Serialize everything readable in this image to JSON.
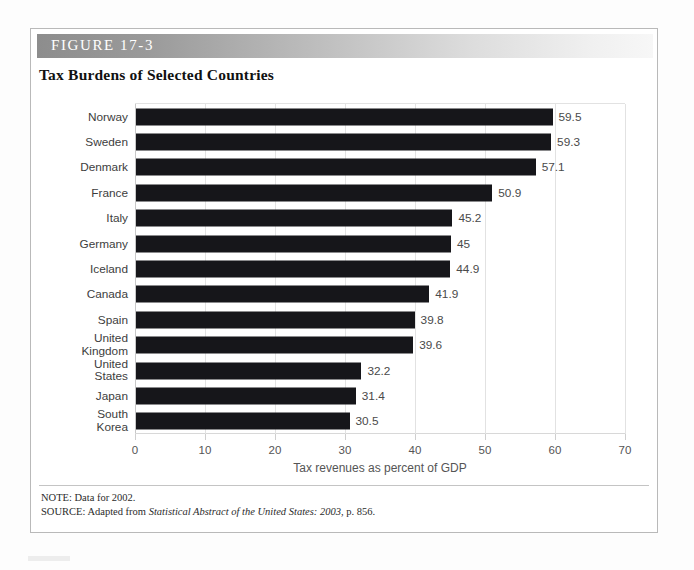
{
  "figure": {
    "label": "FIGURE 17-3",
    "title": "Tax Burdens of Selected Countries",
    "note": "NOTE: Data for 2002.",
    "source_prefix": "SOURCE: Adapted from ",
    "source_italic": "Statistical Abstract of the United States: 2003",
    "source_suffix": ", p. 856."
  },
  "colors": {
    "bar": "#16161a",
    "gridline": "#e2e2e2",
    "header_gradient_start": "#8d8d8d",
    "header_gradient_end": "#f7f7f7",
    "label_text": "#3d3d3d",
    "value_text": "#4a4a4a"
  },
  "chart_data": {
    "type": "bar",
    "orientation": "horizontal",
    "title": "Tax Burdens of Selected Countries",
    "xlabel": "Tax revenues as percent of GDP",
    "ylabel": "",
    "xlim": [
      0,
      70
    ],
    "xticks": [
      0,
      10,
      20,
      30,
      40,
      50,
      60,
      70
    ],
    "xtick_labels": [
      "0",
      "10",
      "20",
      "30",
      "40",
      "50",
      "60",
      "70"
    ],
    "grid": true,
    "legend": false,
    "categories": [
      "Norway",
      "Sweden",
      "Denmark",
      "France",
      "Italy",
      "Germany",
      "Iceland",
      "Canada",
      "Spain",
      "United\nKingdom",
      "United\nStates",
      "Japan",
      "South\nKorea"
    ],
    "values": [
      59.5,
      59.3,
      57.1,
      50.9,
      45.2,
      45,
      44.9,
      41.9,
      39.8,
      39.6,
      32.2,
      31.4,
      30.5
    ],
    "value_labels": [
      "59.5",
      "59.3",
      "57.1",
      "50.9",
      "45.2",
      "45",
      "44.9",
      "41.9",
      "39.8",
      "39.6",
      "32.2",
      "31.4",
      "30.5"
    ]
  }
}
